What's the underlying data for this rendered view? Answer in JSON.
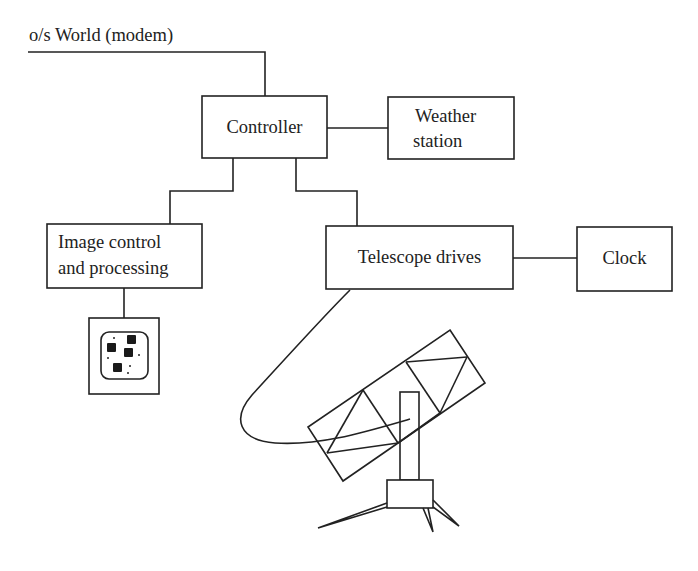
{
  "diagram": {
    "external_link_label": "o/s World (modem)",
    "nodes": [
      {
        "id": "controller",
        "label_lines": [
          "Controller"
        ]
      },
      {
        "id": "weather",
        "label_lines": [
          "Weather",
          "station"
        ]
      },
      {
        "id": "image",
        "label_lines": [
          "Image control",
          "and processing"
        ]
      },
      {
        "id": "drives",
        "label_lines": [
          "Telescope drives"
        ]
      },
      {
        "id": "clock",
        "label_lines": [
          "Clock"
        ]
      }
    ],
    "edges": [
      {
        "from": "external",
        "to": "controller"
      },
      {
        "from": "controller",
        "to": "weather"
      },
      {
        "from": "controller",
        "to": "image"
      },
      {
        "from": "controller",
        "to": "drives"
      },
      {
        "from": "drives",
        "to": "clock"
      },
      {
        "from": "image",
        "to": "monitor"
      },
      {
        "from": "drives",
        "to": "telescope"
      }
    ],
    "illustrations": [
      {
        "id": "monitor",
        "name": "image display monitor"
      },
      {
        "id": "telescope",
        "name": "telescope on tripod mount"
      }
    ],
    "colors": {
      "line": "#222222",
      "background": "#ffffff"
    }
  }
}
